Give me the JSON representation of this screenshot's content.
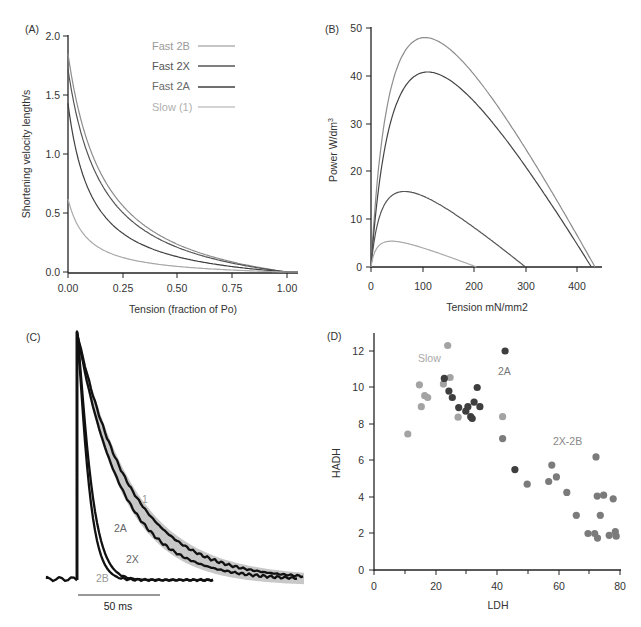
{
  "chart_data": [
    {
      "panel": "(A)",
      "type": "line",
      "title": "",
      "xlabel": "Tension (fraction of Po)",
      "ylabel": "Shortening velocity length/s",
      "xlim": [
        0,
        1.05
      ],
      "ylim": [
        0,
        2.0
      ],
      "xticks": [
        "0.00",
        "0.25",
        "0.50",
        "0.75",
        "1.00"
      ],
      "yticks": [
        "0.0",
        "0.5",
        "1.0",
        "1.5",
        "2.0"
      ],
      "grid": false,
      "legend_position": "upper right",
      "series": [
        {
          "name": "Fast 2B",
          "color": "#8c8c8c",
          "vmax": 1.85,
          "a": 0.17
        },
        {
          "name": "Fast 2X",
          "color": "#555555",
          "vmax": 1.72,
          "a": 0.16
        },
        {
          "name": "Fast 2A",
          "color": "#3f3f3f",
          "vmax": 1.43,
          "a": 0.11
        },
        {
          "name": "Slow (1)",
          "color": "#a8a8a8",
          "vmax": 0.62,
          "a": 0.09
        }
      ]
    },
    {
      "panel": "(B)",
      "type": "line",
      "title": "",
      "xlabel": "Tension mN/mm2",
      "ylabel": "Power W/dm³",
      "xlim": [
        0,
        450
      ],
      "ylim": [
        0,
        50
      ],
      "xticks": [
        "0",
        "100",
        "200",
        "300",
        "400"
      ],
      "yticks": [
        "0",
        "10",
        "20",
        "30",
        "40",
        "50"
      ],
      "grid": false,
      "series": [
        {
          "name": "Fast 2B",
          "color": "#8c8c8c",
          "peak_x": 105,
          "peak_y": 48,
          "p0": 435
        },
        {
          "name": "Fast 2X",
          "color": "#444444",
          "peak_x": 110,
          "peak_y": 40.8,
          "p0": 428
        },
        {
          "name": "Fast 2A",
          "color": "#555555",
          "peak_x": 65,
          "peak_y": 15.8,
          "p0": 300
        },
        {
          "name": "Slow (1)",
          "color": "#a8a8a8",
          "peak_x": 40,
          "peak_y": 5.4,
          "p0": 205
        }
      ]
    },
    {
      "panel": "(C)",
      "type": "line",
      "title": "",
      "xlabel": "",
      "ylabel": "",
      "scale_bar": "50 ms",
      "annotations": [
        "1",
        "2A",
        "2X",
        "2B"
      ],
      "series": [
        {
          "name": "1",
          "tau_ms": 34
        },
        {
          "name": "2A",
          "tau_ms": 28
        },
        {
          "name": "2X",
          "tau_ms": 9
        },
        {
          "name": "2B",
          "tau_ms": 7.5
        }
      ]
    },
    {
      "panel": "(D)",
      "type": "scatter",
      "title": "",
      "xlabel": "LDH",
      "ylabel": "HADH",
      "xlim": [
        0,
        80
      ],
      "ylim": [
        0,
        13
      ],
      "xticks": [
        "0",
        "20",
        "40",
        "60",
        "80"
      ],
      "yticks": [
        "0",
        "2",
        "4",
        "6",
        "8",
        "10",
        "12"
      ],
      "grid": false,
      "annotations": [
        "Slow",
        "2A",
        "2X-2B"
      ],
      "series": [
        {
          "name": "Slow",
          "color": "#a3a3a3",
          "points": [
            [
              24,
              12.3
            ],
            [
              14.8,
              10.15
            ],
            [
              15.4,
              8.95
            ],
            [
              16.5,
              9.55
            ],
            [
              17.5,
              9.45
            ],
            [
              11,
              7.45
            ],
            [
              22.6,
              10.2
            ],
            [
              24.8,
              10.55
            ],
            [
              27.4,
              8.37
            ],
            [
              41.9,
              8.4
            ]
          ]
        },
        {
          "name": "2A",
          "color": "#3e3e3e",
          "points": [
            [
              42.7,
              12.0
            ],
            [
              22.9,
              10.5
            ],
            [
              24.4,
              9.8
            ],
            [
              25.5,
              9.45
            ],
            [
              27.6,
              8.9
            ],
            [
              29.9,
              8.7
            ],
            [
              30.6,
              8.95
            ],
            [
              32.6,
              9.2
            ],
            [
              33.6,
              10.0
            ],
            [
              34.5,
              8.95
            ],
            [
              31.5,
              8.4
            ],
            [
              32,
              8.3
            ],
            [
              45.9,
              5.5
            ]
          ]
        },
        {
          "name": "2X-2B",
          "color": "#7b7b7b",
          "points": [
            [
              41.9,
              7.2
            ],
            [
              49.9,
              4.7
            ],
            [
              57.9,
              5.75
            ],
            [
              56.9,
              4.85
            ],
            [
              59.4,
              5.1
            ],
            [
              62.8,
              4.25
            ],
            [
              65.9,
              3.0
            ],
            [
              72.3,
              6.2
            ],
            [
              72.7,
              4.05
            ],
            [
              74.8,
              4.1
            ],
            [
              77.9,
              3.9
            ],
            [
              73.7,
              3.0
            ],
            [
              69.7,
              2.0
            ],
            [
              71.9,
              2.0
            ],
            [
              72.8,
              1.75
            ],
            [
              76.6,
              1.9
            ],
            [
              78.6,
              2.1
            ],
            [
              78.9,
              1.85
            ]
          ]
        }
      ]
    }
  ],
  "panels": {
    "a": {
      "label": "(A)",
      "xlabel": "Tension (fraction of Po)",
      "ylabel": "Shortening velocity length/s",
      "xticks": [
        "0.00",
        "0.25",
        "0.50",
        "0.75",
        "1.00"
      ],
      "yticks": [
        "0.0",
        "0.5",
        "1.0",
        "1.5",
        "2.0"
      ],
      "legend": [
        "Fast 2B",
        "Fast 2X",
        "Fast 2A",
        "Slow (1)"
      ]
    },
    "b": {
      "label": "(B)",
      "xlabel": "Tension mN/mm2",
      "ylabel": "Power W/dm",
      "ylabel_sup": "3",
      "xticks": [
        "0",
        "100",
        "200",
        "300",
        "400"
      ],
      "yticks": [
        "0",
        "10",
        "20",
        "30",
        "40",
        "50"
      ]
    },
    "c": {
      "label": "(C)",
      "scale_bar": "50 ms",
      "annotations": [
        "1",
        "2A",
        "2X",
        "2B"
      ]
    },
    "d": {
      "label": "(D)",
      "xlabel": "LDH",
      "ylabel": "HADH",
      "xticks": [
        "0",
        "20",
        "40",
        "60",
        "80"
      ],
      "yticks": [
        "0",
        "2",
        "4",
        "6",
        "8",
        "10",
        "12"
      ],
      "annotations": [
        "Slow",
        "2A",
        "2X-2B"
      ]
    }
  }
}
